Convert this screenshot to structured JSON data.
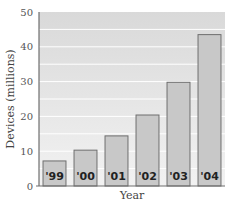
{
  "chart_data": {
    "type": "bar",
    "title": "",
    "xlabel": "Year",
    "ylabel": "Devices (millions)",
    "categories": [
      "'99",
      "'00",
      "'01",
      "'02",
      "'03",
      "'04"
    ],
    "values": [
      7.2,
      10.3,
      14.4,
      20.4,
      29.8,
      43.5
    ],
    "ylim": [
      0,
      50
    ],
    "yticks": [
      0,
      10,
      20,
      30,
      40,
      50
    ],
    "grid": true,
    "gridlines_minor": [
      5,
      15,
      25,
      35,
      45
    ],
    "bar_labels_inside": true,
    "colors": {
      "plot_background_top": "#d9d9d9",
      "plot_background_bottom": "#f2f2f2",
      "bar_fill": "#c8c8c8",
      "bar_stroke": "#6e6e6e",
      "gridline": "#ffffff",
      "axis": "#6e6e6e"
    }
  }
}
